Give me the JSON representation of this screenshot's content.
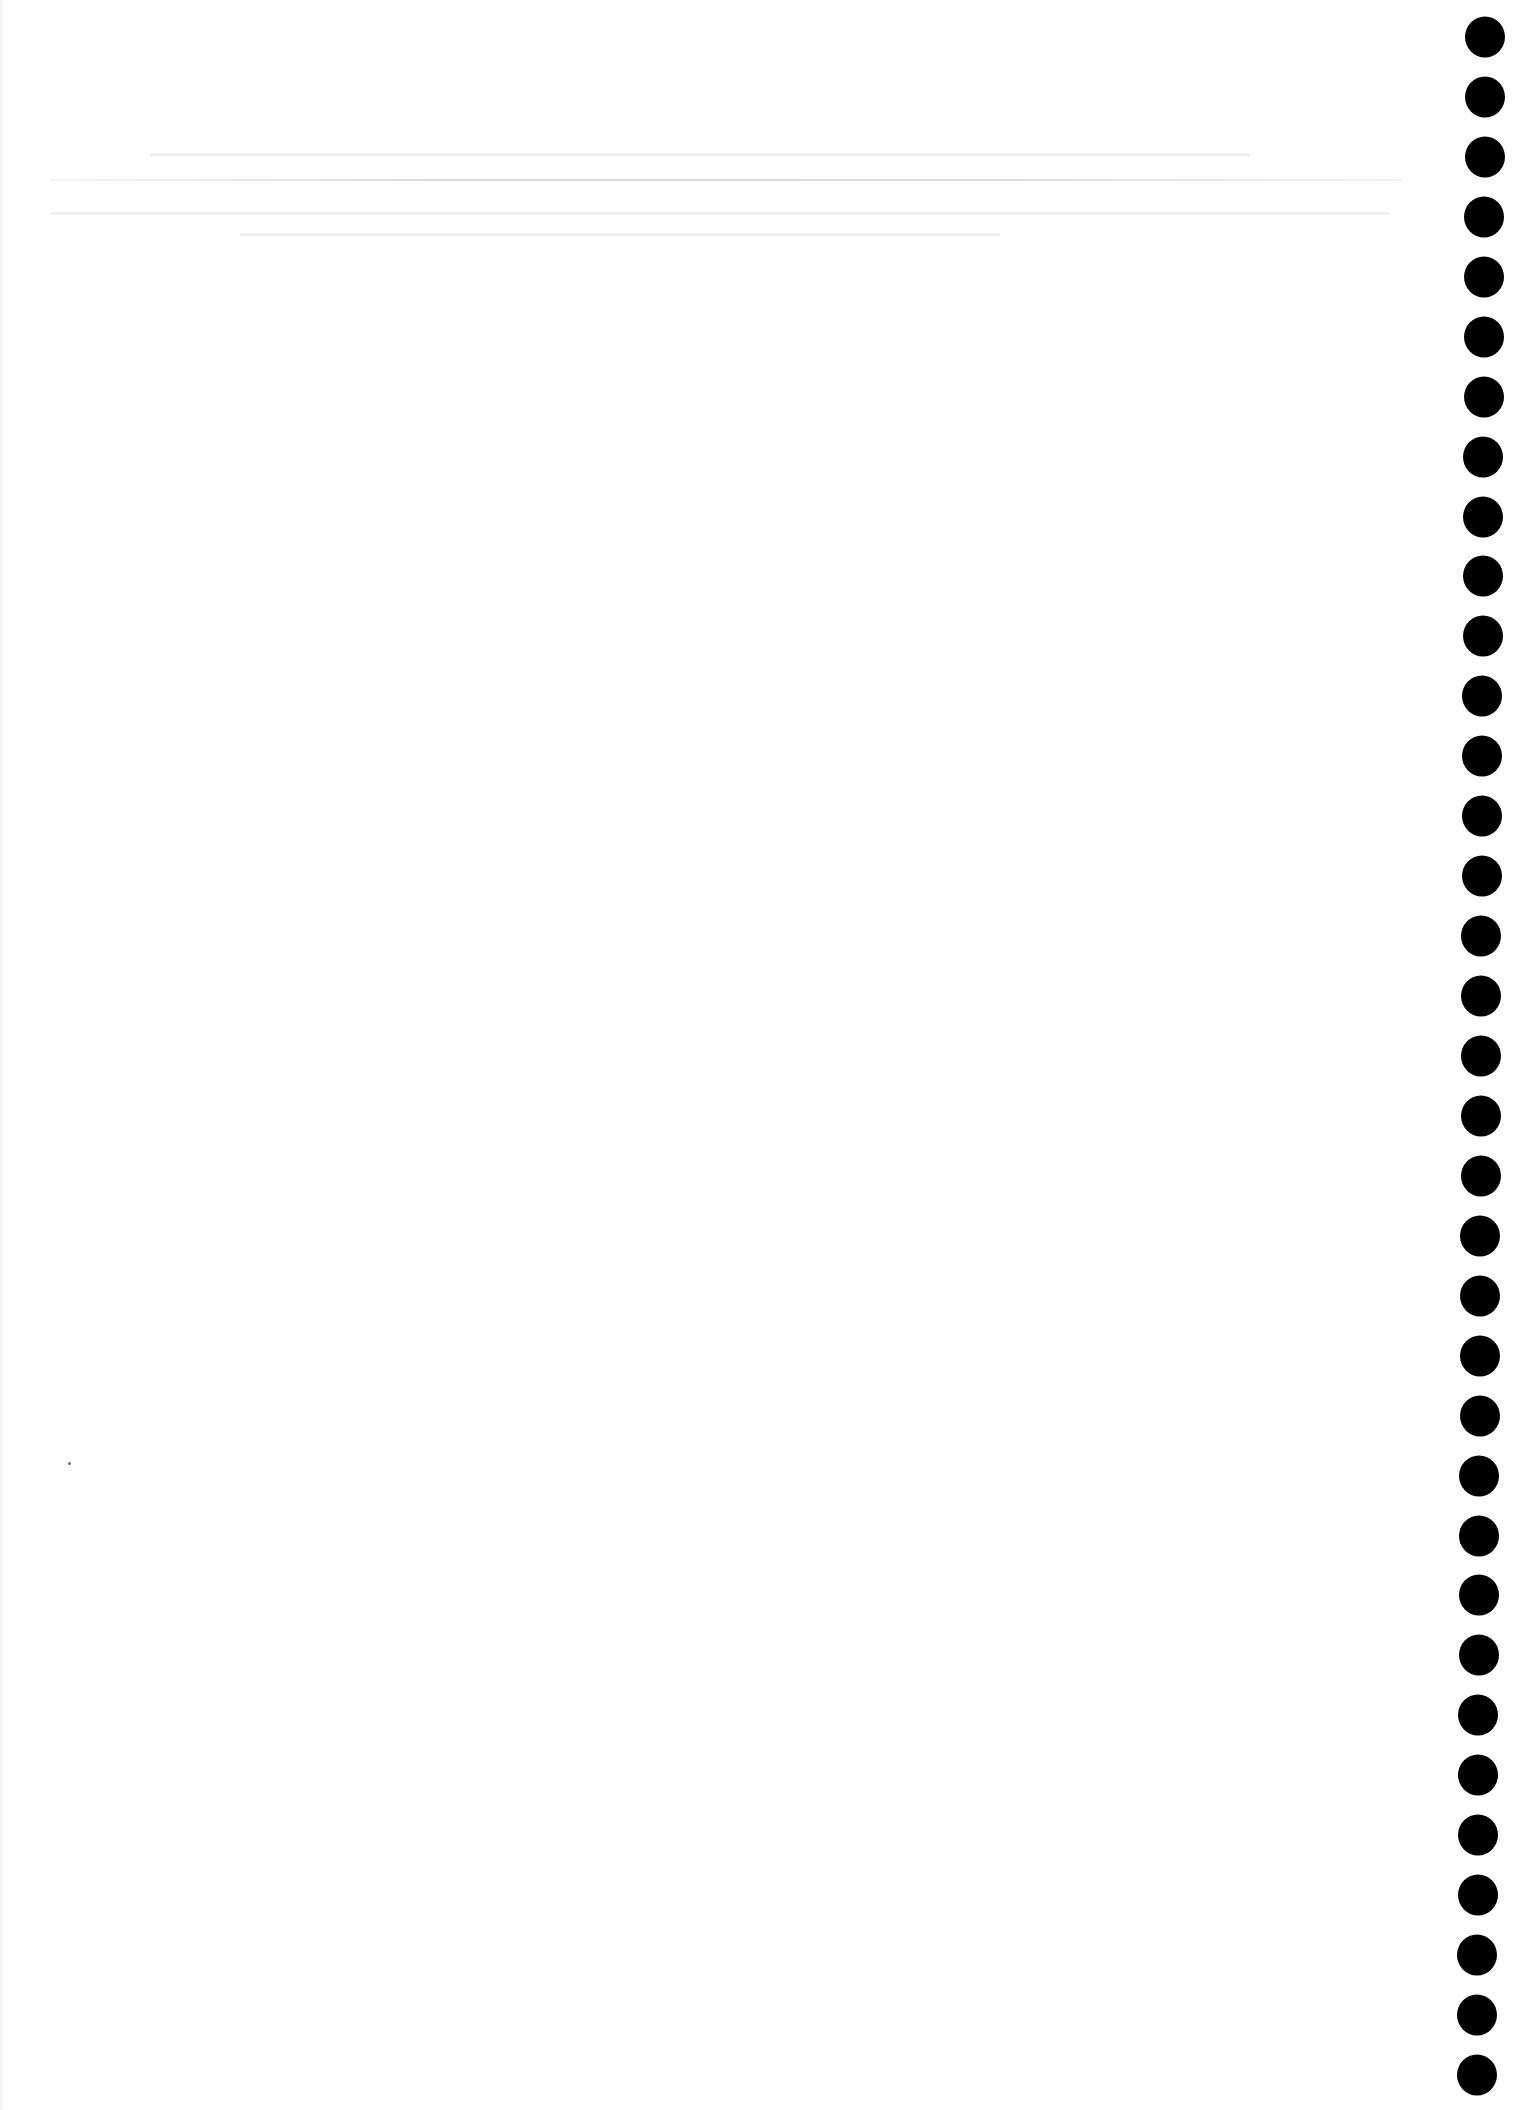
{
  "document": {
    "type": "scanned-blank-page",
    "background_color": "#fefefe",
    "text_content": ""
  },
  "header_rule": {
    "color": "#bebebe",
    "x_start": 50,
    "x_end": 1402,
    "y": 180
  },
  "punch_holes": {
    "color": "#000000",
    "count": 35,
    "diameter": 40,
    "first_center": {
      "x": 1485,
      "y": 37
    },
    "last_center": {
      "x": 1477,
      "y": 2075
    }
  },
  "specks": [
    {
      "x": 69,
      "y": 1463
    }
  ]
}
